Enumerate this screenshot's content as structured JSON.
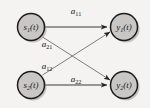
{
  "figure": {
    "background_color": "#f4f3f1",
    "node_fill_color": "#c9c7c5",
    "node_stroke_color": "#1c1c1c",
    "edge_color": "#3a3a3a"
  },
  "nodes": [
    {
      "id": "s1",
      "base": "s",
      "sub": "1",
      "suffix": "(t)",
      "role": "source",
      "cx": 31,
      "cy": 27,
      "r": 14
    },
    {
      "id": "s2",
      "base": "s",
      "sub": "2",
      "suffix": "(t)",
      "role": "source",
      "cx": 31,
      "cy": 85,
      "r": 14
    },
    {
      "id": "y1",
      "base": "y",
      "sub": "1",
      "suffix": "(t)",
      "role": "output",
      "cx": 124,
      "cy": 27,
      "r": 14
    },
    {
      "id": "y2",
      "base": "y",
      "sub": "2",
      "suffix": "(t)",
      "role": "output",
      "cx": 124,
      "cy": 85,
      "r": 14
    }
  ],
  "edges": [
    {
      "id": "e11",
      "from": "s1",
      "to": "y1",
      "base": "a",
      "sub": "11",
      "label_x": 76,
      "label_y": 14
    },
    {
      "id": "e21",
      "from": "s1",
      "to": "y2",
      "base": "a",
      "sub": "21",
      "label_x": 47,
      "label_y": 47
    },
    {
      "id": "e12",
      "from": "s2",
      "to": "y1",
      "base": "a",
      "sub": "12",
      "label_x": 47,
      "label_y": 69
    },
    {
      "id": "e22",
      "from": "s2",
      "to": "y2",
      "base": "a",
      "sub": "22",
      "label_x": 76,
      "label_y": 82
    }
  ]
}
